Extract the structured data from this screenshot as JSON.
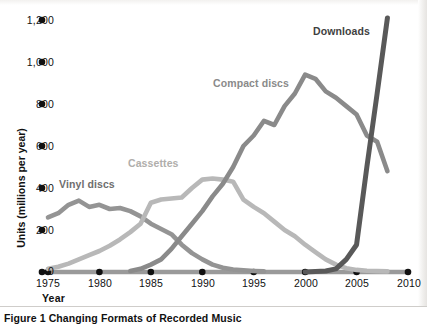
{
  "figure": {
    "caption": "Figure 1  Changing Formats of Recorded Music",
    "xlabel": "Year",
    "ylabel": "Units (millions per year)"
  },
  "axis": {
    "y_ticks": [
      "0",
      "200",
      "400",
      "600",
      "800",
      "1,000",
      "1,200"
    ],
    "x_ticks": [
      "1975",
      "1980",
      "1985",
      "1990",
      "1995",
      "2000",
      "2005",
      "2010"
    ]
  },
  "series_labels": {
    "vinyl": "Vinyl discs",
    "cassettes": "Cassettes",
    "compact_discs": "Compact discs",
    "downloads": "Downloads"
  },
  "colors": {
    "vinyl": "#949494",
    "cassettes": "#b8b8b8",
    "compact_discs": "#8a8a8a",
    "downloads": "#595959",
    "axis_line": "#9a9a9a",
    "tick_dot": "#111111",
    "background": "#ffffff",
    "text": "#111111"
  },
  "chart_data": {
    "type": "line",
    "title": "Figure 1  Changing Formats of Recorded Music",
    "xlabel": "Year",
    "ylabel": "Units (millions per year)",
    "xlim": [
      1975,
      2010
    ],
    "ylim": [
      0,
      1200
    ],
    "ytick_values": [
      0,
      200,
      400,
      600,
      800,
      1000,
      1200
    ],
    "xtick_values": [
      1975,
      1980,
      1985,
      1990,
      1995,
      2000,
      2005,
      2010
    ],
    "grid": false,
    "legend": "inline-labels",
    "series": [
      {
        "name": "Vinyl discs",
        "color": "#949494",
        "x": [
          1975,
          1976,
          1977,
          1978,
          1979,
          1980,
          1981,
          1982,
          1983,
          1984,
          1985,
          1986,
          1987,
          1988,
          1989,
          1990,
          1991,
          1992,
          1993,
          1994,
          1995,
          1996
        ],
        "values": [
          260,
          280,
          320,
          340,
          310,
          320,
          300,
          305,
          290,
          265,
          230,
          205,
          180,
          130,
          90,
          60,
          35,
          20,
          12,
          8,
          5,
          3
        ]
      },
      {
        "name": "Cassettes",
        "color": "#b8b8b8",
        "x": [
          1975,
          1976,
          1977,
          1978,
          1979,
          1980,
          1981,
          1982,
          1983,
          1984,
          1985,
          1986,
          1987,
          1988,
          1989,
          1990,
          1991,
          1992,
          1993,
          1994,
          1995,
          1996,
          1997,
          1998,
          1999,
          2000,
          2001,
          2002,
          2003,
          2004,
          2005,
          2006,
          2007,
          2008
        ],
        "values": [
          15,
          25,
          40,
          60,
          80,
          100,
          125,
          155,
          190,
          230,
          330,
          345,
          350,
          355,
          400,
          440,
          445,
          440,
          430,
          345,
          310,
          280,
          240,
          200,
          170,
          130,
          95,
          60,
          35,
          18,
          10,
          6,
          4,
          3
        ]
      },
      {
        "name": "Compact discs",
        "color": "#8a8a8a",
        "x": [
          1983,
          1984,
          1985,
          1986,
          1987,
          1988,
          1989,
          1990,
          1991,
          1992,
          1993,
          1994,
          1995,
          1996,
          1997,
          1998,
          1999,
          2000,
          2001,
          2002,
          2003,
          2004,
          2005,
          2006,
          2007,
          2008
        ],
        "values": [
          5,
          15,
          35,
          60,
          110,
          170,
          230,
          290,
          360,
          420,
          500,
          600,
          650,
          720,
          700,
          790,
          850,
          940,
          920,
          860,
          830,
          790,
          750,
          650,
          620,
          480
        ]
      },
      {
        "name": "Downloads",
        "color": "#595959",
        "x": [
          2000,
          2001,
          2002,
          2003,
          2004,
          2005,
          2006,
          2007,
          2008
        ],
        "values": [
          0,
          2,
          5,
          15,
          60,
          130,
          500,
          850,
          1210
        ]
      }
    ]
  }
}
